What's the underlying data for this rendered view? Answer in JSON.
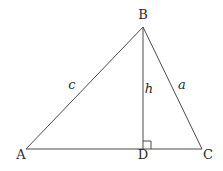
{
  "diagram": {
    "type": "triangle-with-altitude",
    "vertices": {
      "A": {
        "label": "A",
        "x": 26,
        "y": 149
      },
      "B": {
        "label": "B",
        "x": 143,
        "y": 27
      },
      "C": {
        "label": "C",
        "x": 202,
        "y": 149
      },
      "D": {
        "label": "D",
        "x": 143,
        "y": 149
      }
    },
    "sides": {
      "c": {
        "label": "c",
        "from": "A",
        "to": "B"
      },
      "a": {
        "label": "a",
        "from": "B",
        "to": "C"
      },
      "h": {
        "label": "h",
        "from": "B",
        "to": "D",
        "note": "altitude"
      }
    },
    "right_angle_marker": {
      "at": "D"
    }
  }
}
